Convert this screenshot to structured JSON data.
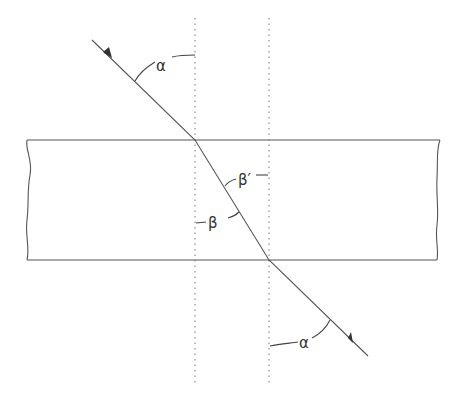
{
  "diagram": {
    "colors": {
      "line": "#555555",
      "dotted": "#777777",
      "background": "#ffffff"
    },
    "labels": {
      "alpha_incident": "α",
      "beta_prime": "β′",
      "beta": "β",
      "alpha_exit": "α"
    },
    "plate": {
      "top_y": 140,
      "bottom_y": 260,
      "left_x": 27,
      "right_x": 440
    },
    "normals": [
      {
        "x": 195,
        "y1": 18,
        "y2": 385
      },
      {
        "x": 269,
        "y1": 18,
        "y2": 385
      }
    ],
    "ray": [
      [
        92,
        40
      ],
      [
        195,
        140
      ],
      [
        269,
        260
      ],
      [
        368,
        356
      ]
    ]
  }
}
